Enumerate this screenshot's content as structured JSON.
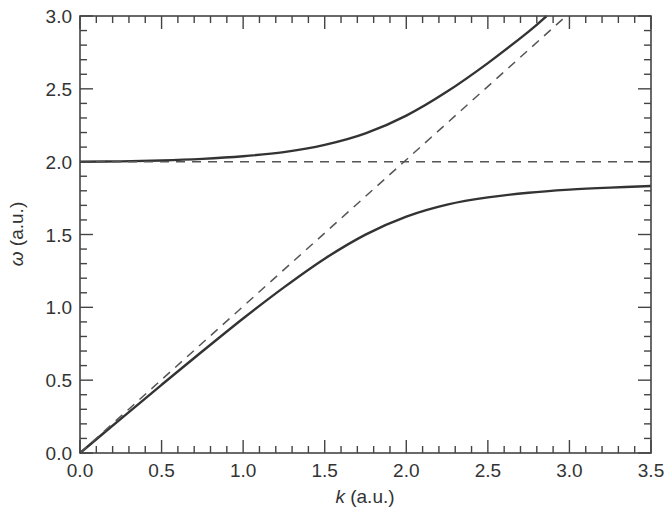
{
  "chart_data": {
    "type": "line",
    "title": "",
    "xlabel": "k (a.u.)",
    "xlabel_var": "k",
    "xlabel_unit": " (a.u.)",
    "ylabel": "ω (a.u.)",
    "ylabel_var": "ω",
    "ylabel_unit": " (a.u.)",
    "xlim": [
      0.0,
      3.5
    ],
    "ylim": [
      0.0,
      3.0
    ],
    "grid": false,
    "legend": null,
    "x_ticks": [
      "0.0",
      "0.5",
      "1.0",
      "1.5",
      "2.0",
      "2.5",
      "3.0",
      "3.5"
    ],
    "y_ticks": [
      "0.0",
      "0.5",
      "1.0",
      "1.5",
      "2.0",
      "2.5",
      "3.0"
    ],
    "minor_tick_step": 0.1,
    "series": [
      {
        "name": "upper polariton branch",
        "style": "solid",
        "color": "#333333",
        "x": [
          0.0,
          0.25,
          0.5,
          0.75,
          1.0,
          1.25,
          1.5,
          1.75,
          2.0,
          2.25,
          2.5,
          2.75,
          2.86
        ],
        "y": [
          2.0,
          2.002,
          2.008,
          2.019,
          2.037,
          2.066,
          2.115,
          2.194,
          2.316,
          2.481,
          2.677,
          2.893,
          3.0
        ]
      },
      {
        "name": "lower polariton branch",
        "style": "solid",
        "color": "#333333",
        "x": [
          0.0,
          0.25,
          0.5,
          0.75,
          1.0,
          1.25,
          1.5,
          1.75,
          2.0,
          2.25,
          2.5,
          2.75,
          3.0,
          3.25,
          3.5
        ],
        "y": [
          0.0,
          0.235,
          0.468,
          0.698,
          0.923,
          1.137,
          1.334,
          1.499,
          1.623,
          1.705,
          1.755,
          1.787,
          1.808,
          1.822,
          1.833
        ]
      },
      {
        "name": "photon light line",
        "style": "dashed",
        "color": "#555555",
        "x": [
          0.0,
          2.98
        ],
        "y": [
          0.0,
          3.0
        ]
      },
      {
        "name": "uncoupled oscillator frequency",
        "style": "dashed",
        "color": "#555555",
        "x": [
          0.0,
          3.5
        ],
        "y": [
          2.0,
          2.0
        ]
      }
    ]
  }
}
